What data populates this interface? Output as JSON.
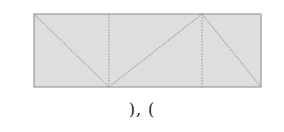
{
  "diagram": {
    "rect": {
      "x": 34,
      "y": 14,
      "w": 227,
      "h": 73,
      "fill": "#dedede",
      "stroke": "#9a9a9a"
    },
    "dividers": [
      {
        "x1": 109,
        "y1": 14,
        "x2": 109,
        "y2": 87
      },
      {
        "x1": 202,
        "y1": 14,
        "x2": 202,
        "y2": 87
      }
    ],
    "diagonals": [
      {
        "x1": 34,
        "y1": 14,
        "x2": 109,
        "y2": 87
      },
      {
        "x1": 109,
        "y1": 87,
        "x2": 202,
        "y2": 14
      },
      {
        "x1": 202,
        "y1": 14,
        "x2": 261,
        "y2": 87
      }
    ],
    "line_color": "#8c8c8c"
  },
  "caption": "), ("
}
